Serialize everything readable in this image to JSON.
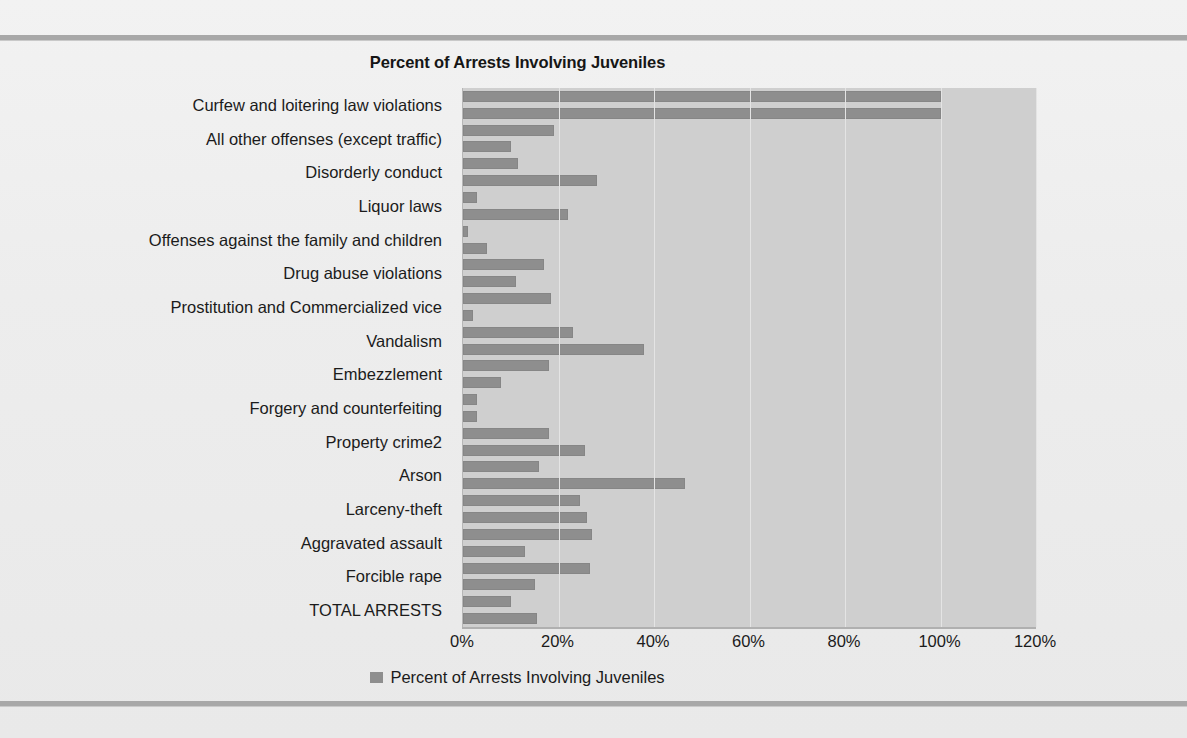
{
  "chart_data": {
    "type": "bar",
    "orientation": "horizontal",
    "title": "Percent of Arrests Involving Juveniles",
    "xlabel": "",
    "ylabel": "",
    "xlim": [
      0,
      120
    ],
    "xticks": [
      "0%",
      "20%",
      "40%",
      "60%",
      "80%",
      "100%",
      "120%"
    ],
    "xtick_values": [
      0,
      20,
      40,
      60,
      80,
      100,
      120
    ],
    "grid": true,
    "legend": [
      "Percent of Arrests Involving Juveniles"
    ],
    "legend_position": "bottom-center",
    "series_name": "Percent of Arrests Involving Juveniles",
    "bar_color": "#8e8e8e",
    "plot_bg_color": "#cfcfcf",
    "categories": [
      "Curfew and loitering law violations",
      "All other offenses (except traffic)",
      "Disorderly conduct",
      "Liquor laws",
      "Offenses against the family and children",
      "Drug abuse violations",
      "Prostitution and Commercialized vice",
      "Vandalism",
      "Embezzlement",
      "Forgery and counterfeiting",
      "Property crime2",
      "Arson",
      "Larceny-theft",
      "Aggravated assault",
      "Forcible rape",
      "TOTAL ARRESTS"
    ],
    "bars": [
      100.0,
      100.0,
      19.0,
      10.0,
      11.5,
      28.0,
      3.0,
      22.0,
      1.0,
      5.0,
      17.0,
      11.0,
      18.5,
      2.0,
      23.0,
      38.0,
      18.0,
      8.0,
      3.0,
      3.0,
      18.0,
      25.5,
      16.0,
      46.5,
      24.5,
      26.0,
      27.0,
      13.0,
      26.5,
      15.0,
      10.0,
      15.5
    ]
  },
  "labels": {
    "x_ticks": [
      "0%",
      "20%",
      "40%",
      "60%",
      "80%",
      "100%",
      "120%"
    ]
  }
}
